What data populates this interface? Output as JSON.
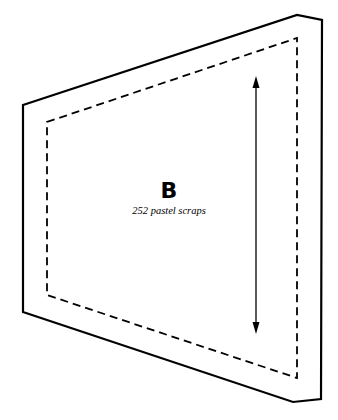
{
  "piece": {
    "letter": "B",
    "caption": "252 pastel scraps"
  },
  "shape": {
    "outer_outline": [
      [
        23,
        105
      ],
      [
        297,
        15
      ],
      [
        322,
        20
      ],
      [
        321,
        399
      ],
      [
        293,
        402
      ],
      [
        23,
        312
      ]
    ],
    "seam_line_dashed": [
      [
        47,
        122
      ],
      [
        297,
        38
      ],
      [
        297,
        378
      ],
      [
        47,
        295
      ]
    ],
    "grain_arrow": {
      "x": 256,
      "y_top": 77,
      "y_bottom": 333,
      "direction": "both"
    }
  },
  "colors": {
    "line": "#000000",
    "background": "#ffffff"
  }
}
